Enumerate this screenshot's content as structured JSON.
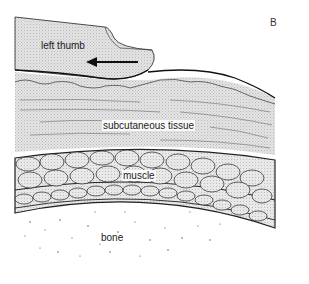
{
  "figure": {
    "panel_letter": "B",
    "labels": {
      "thumb": "left thumb",
      "subcutaneous": "subcutaneous tissue",
      "muscle": "muscle",
      "bone": "bone"
    },
    "annotations": {
      "arrow_direction": "left"
    },
    "colors": {
      "tissue_fill": "#dcdcdc",
      "line": "#222222",
      "background": "#ffffff"
    }
  }
}
